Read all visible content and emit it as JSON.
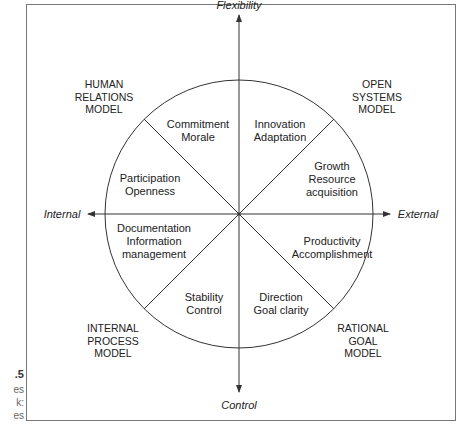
{
  "figure": {
    "caption_fragments": [
      ".5",
      "es",
      "k:",
      "es"
    ],
    "axes": {
      "top": "Flexibility",
      "bottom": "Control",
      "left": "Internal",
      "right": "External"
    },
    "models": {
      "top_left": [
        "HUMAN",
        "RELATIONS",
        "MODEL"
      ],
      "top_right": [
        "OPEN",
        "SYSTEMS",
        "MODEL"
      ],
      "bottom_left": [
        "INTERNAL",
        "PROCESS",
        "MODEL"
      ],
      "bottom_right": [
        "RATIONAL",
        "GOAL",
        "MODEL"
      ]
    },
    "segments": {
      "commitment": [
        "Commitment",
        "Morale"
      ],
      "innovation": [
        "Innovation",
        "Adaptation"
      ],
      "growth": [
        "Growth",
        "Resource",
        "acquisition"
      ],
      "productivity": [
        "Productivity",
        "Accomplishment"
      ],
      "direction": [
        "Direction",
        "Goal clarity"
      ],
      "stability": [
        "Stability",
        "Control"
      ],
      "documentation": [
        "Documentation",
        "Information",
        "management"
      ],
      "participation": [
        "Participation",
        "Openness"
      ]
    },
    "colors": {
      "line": "#333333",
      "frame": "#777777",
      "text": "#222222"
    }
  }
}
